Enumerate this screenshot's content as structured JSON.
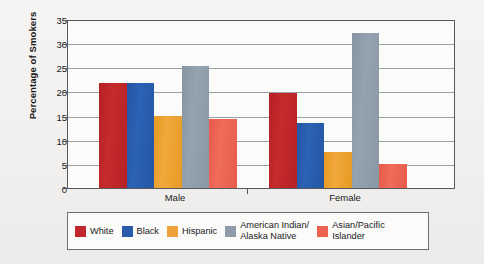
{
  "chart_data": {
    "type": "bar",
    "title": "",
    "subtitle": "",
    "xlabel": "",
    "ylabel": "Percentage of Smokers",
    "categories": [
      "Male",
      "Female"
    ],
    "ylim": [
      0,
      35
    ],
    "ytick_step": 5,
    "yticks": [
      "0",
      "5",
      "10",
      "15",
      "20",
      "25",
      "30",
      "35"
    ],
    "grid": true,
    "legend_position": "bottom",
    "series": [
      {
        "name": "White",
        "color": "#c1272d",
        "values": [
          22.0,
          20.0
        ]
      },
      {
        "name": "Black",
        "color": "#2b5cab",
        "values": [
          22.0,
          13.7
        ]
      },
      {
        "name": "Hispanic",
        "color": "#eda23a",
        "values": [
          15.0,
          7.6
        ]
      },
      {
        "name": "American Indian/\nAlaska Native",
        "color": "#8e9ca9",
        "values": [
          25.5,
          32.5
        ]
      },
      {
        "name": "Asian/Pacific\nIslander",
        "color": "#ec6150",
        "values": [
          14.5,
          5.1
        ]
      }
    ]
  },
  "axis": {
    "y_title": "Percentage of Smokers",
    "tick_0": "0",
    "tick_5": "5",
    "tick_10": "10",
    "tick_15": "15",
    "tick_20": "20",
    "tick_25": "25",
    "tick_30": "30",
    "tick_35": "35",
    "group_male": "Male",
    "group_female": "Female"
  },
  "legend": {
    "items": [
      {
        "label": "White",
        "color": "#c1272d"
      },
      {
        "label": "Black",
        "color": "#2b5cab"
      },
      {
        "label": "Hispanic",
        "color": "#eda23a"
      },
      {
        "label": "American Indian/\nAlaska Native",
        "color": "#8e9ca9"
      },
      {
        "label": "Asian/Pacific\nIslander",
        "color": "#ec6150"
      }
    ]
  }
}
